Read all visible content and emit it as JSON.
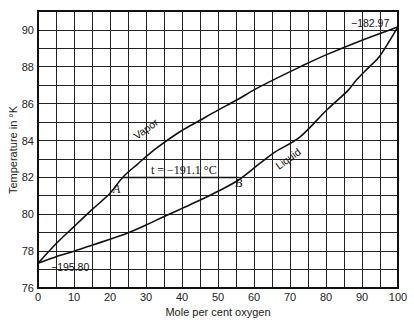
{
  "chart_data": {
    "type": "line",
    "title": "",
    "xlabel": "Mole per cent oxygen",
    "ylabel": "Temperature in °K",
    "xlim": [
      0,
      100
    ],
    "ylim": [
      76,
      91
    ],
    "grid": true,
    "x_ticks": [
      0,
      10,
      20,
      30,
      40,
      50,
      60,
      70,
      80,
      90,
      100
    ],
    "x_tick_labels": [
      "0",
      "10",
      "20",
      "30",
      "40",
      "50",
      "60",
      "70",
      "80",
      "90",
      "100"
    ],
    "x_minor_step": 5,
    "y_ticks": [
      76,
      78,
      80,
      82,
      84,
      86,
      88,
      90
    ],
    "y_tick_labels": [
      "76",
      "78",
      "80",
      "82",
      "84",
      "86",
      "88",
      "90"
    ],
    "y_minor_step": 1,
    "series": [
      {
        "name": "Vapor",
        "x": [
          0,
          5,
          10,
          15,
          20,
          23.5,
          27.5,
          33,
          39.4,
          45,
          50,
          55.2,
          60,
          64.4,
          72.8,
          80,
          90,
          100
        ],
        "y": [
          77.34,
          78.4,
          79.33,
          80.25,
          81.14,
          82.0,
          82.7,
          83.6,
          84.48,
          85.1,
          85.65,
          86.2,
          86.75,
          87.2,
          88.0,
          88.65,
          89.45,
          90.17
        ]
      },
      {
        "name": "Liquid",
        "x": [
          0,
          5,
          10,
          15,
          20,
          24.7,
          30,
          34.9,
          40,
          45.1,
          50,
          55.7,
          61.7,
          66,
          72.8,
          80.2,
          86,
          88.5,
          92,
          95,
          100
        ],
        "y": [
          77.34,
          77.7,
          78.0,
          78.32,
          78.65,
          78.97,
          79.42,
          79.87,
          80.32,
          80.77,
          81.25,
          81.86,
          82.77,
          83.4,
          84.2,
          85.66,
          86.7,
          87.3,
          88.0,
          88.6,
          90.17
        ]
      }
    ],
    "tie_line": {
      "label": "t = −191.1 °C",
      "y": 82.0,
      "x_start": 23.5,
      "x_end": 55.7
    },
    "points": [
      {
        "label": "A",
        "x": 23.5,
        "y": 82.0
      },
      {
        "label": "B",
        "x": 55.7,
        "y": 82.0
      }
    ],
    "annotations": [
      {
        "text": "−182.97",
        "x": 100,
        "y": 90.17,
        "meaning": "boiling point of O2 (°C)"
      },
      {
        "text": "−195.80",
        "x": 0,
        "y": 77.34,
        "meaning": "boiling point of N2 (°C)"
      },
      {
        "text": "Vapor",
        "curve": "Vapor"
      },
      {
        "text": "Liquid",
        "curve": "Liquid"
      }
    ]
  },
  "labels": {
    "xlabel": "Mole per cent oxygen",
    "ylabel": "Temperature in °K",
    "vapor": "Vapor",
    "liquid": "Liquid",
    "tie": "t = −191.1 °C",
    "point_a": "A",
    "point_b": "B",
    "top_right": "−182.97",
    "bottom_left": "−195.80"
  }
}
